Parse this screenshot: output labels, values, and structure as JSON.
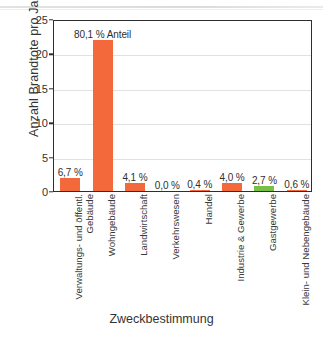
{
  "chart_data": {
    "type": "bar",
    "title": "",
    "xlabel": "Zweckbestimmung",
    "ylabel": "Anzahl Brandtote pro Jahr",
    "ylim": [
      0,
      25
    ],
    "yticks": [
      0,
      5,
      10,
      15,
      20,
      25
    ],
    "grid": true,
    "legend": "none",
    "categories": [
      "Verwaltungs- und öffentl. Gebäude",
      "Wohngebäude",
      "Landwirtschaft",
      "Verkehrswesen",
      "Handel",
      "Industrie & Gewerbe",
      "Gastgewerbe",
      "Klein- und Nebengebäude"
    ],
    "values": [
      1.84,
      22.0,
      1.13,
      0.0,
      0.11,
      1.1,
      0.74,
      0.17
    ],
    "data_labels": [
      "6,7 %",
      "80,1 % Anteil",
      "4,1 %",
      "0,0 %",
      "0,4 %",
      "4,0 %",
      "2,7 %",
      "0,6 %"
    ],
    "percent_values": [
      6.7,
      80.1,
      4.1,
      0.0,
      0.4,
      4.0,
      2.7,
      0.6
    ],
    "bar_colors": [
      "#F4693C",
      "#F4693C",
      "#F4693C",
      "#F4693C",
      "#F4693C",
      "#F4693C",
      "#75C045",
      "#F4693C"
    ],
    "colors": {
      "orange": "#F4693C",
      "green": "#75C045",
      "axis": "#2e2e2e",
      "grid": "#e2e2e2",
      "text": "#343434"
    }
  }
}
